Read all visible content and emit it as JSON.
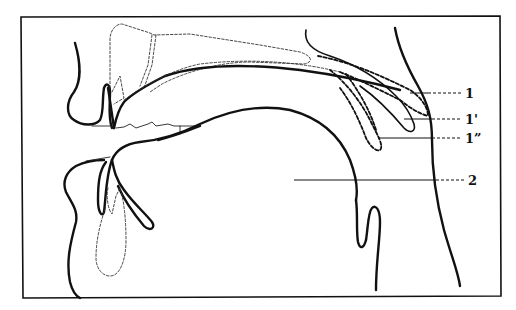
{
  "figure": {
    "type": "sagittal vocal tract diagram",
    "labels": [
      {
        "id": "label-1",
        "text": "1"
      },
      {
        "id": "label-1-prime",
        "text": "1'"
      },
      {
        "id": "label-1-double-prime",
        "text": "1”"
      },
      {
        "id": "label-2",
        "text": "2"
      }
    ],
    "colors": {
      "line": "#111111",
      "background": "#ffffff"
    }
  }
}
